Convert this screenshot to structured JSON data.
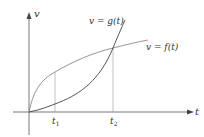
{
  "diagram": {
    "axes": {
      "x_label": "t",
      "y_label": "v"
    },
    "curves": [
      {
        "name": "g",
        "label": "v = g(t)",
        "shape": "convex, increasing steeply"
      },
      {
        "name": "f",
        "label": "v = f(t)",
        "shape": "concave, increasing"
      }
    ],
    "ticks": [
      {
        "label": "t",
        "sub": "1"
      },
      {
        "label": "t",
        "sub": "2"
      }
    ],
    "colors": {
      "axis": "#555555",
      "curve_g": "#444444",
      "curve_f": "#888888",
      "guide": "#999999"
    }
  }
}
